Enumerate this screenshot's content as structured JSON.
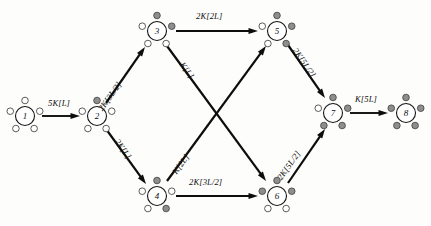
{
  "figure": {
    "node_fill_color": "#ffffff",
    "satellite_open_color": "#ffffff",
    "satellite_filled_color": "#8e8e8e",
    "stroke_color": "#0d0d0d"
  },
  "nodes": [
    {
      "id": "1",
      "label": "1",
      "cx": 25,
      "cy": 116,
      "r": 9.5,
      "sat_r": 3.3,
      "sat_orbit": 15.5,
      "satellites": [
        "open",
        "open",
        "open",
        "open",
        "open"
      ]
    },
    {
      "id": "2",
      "label": "2",
      "cx": 97,
      "cy": 116,
      "r": 9.5,
      "sat_r": 3.3,
      "sat_orbit": 15.5,
      "satellites": [
        "filled",
        "open",
        "open",
        "open",
        "open"
      ]
    },
    {
      "id": "3",
      "label": "3",
      "cx": 157,
      "cy": 31,
      "r": 9.5,
      "sat_r": 3.3,
      "sat_orbit": 15.5,
      "satellites": [
        "filled",
        "filled",
        "open",
        "open",
        "open"
      ]
    },
    {
      "id": "4",
      "label": "4",
      "cx": 157,
      "cy": 196,
      "r": 9.5,
      "sat_r": 3.3,
      "sat_orbit": 15.5,
      "satellites": [
        "filled",
        "open",
        "filled",
        "open",
        "open"
      ]
    },
    {
      "id": "5",
      "label": "5",
      "cx": 277,
      "cy": 31,
      "r": 9.5,
      "sat_r": 3.3,
      "sat_orbit": 15.5,
      "satellites": [
        "filled",
        "filled",
        "filled",
        "open",
        "open"
      ]
    },
    {
      "id": "6",
      "label": "6",
      "cx": 277,
      "cy": 196,
      "r": 9.5,
      "sat_r": 3.3,
      "sat_orbit": 15.5,
      "satellites": [
        "filled",
        "filled",
        "open",
        "open",
        "filled"
      ]
    },
    {
      "id": "7",
      "label": "7",
      "cx": 333,
      "cy": 113,
      "r": 9.5,
      "sat_r": 3.3,
      "sat_orbit": 15.5,
      "satellites": [
        "filled",
        "filled",
        "filled",
        "filled",
        "open"
      ]
    },
    {
      "id": "8",
      "label": "8",
      "cx": 406,
      "cy": 113,
      "r": 9.5,
      "sat_r": 3.3,
      "sat_orbit": 15.5,
      "satellites": [
        "filled",
        "filled",
        "filled",
        "filled",
        "filled"
      ]
    }
  ],
  "edges": [
    {
      "id": "e1-2",
      "from": "1",
      "to": "2",
      "label": "5K[L]",
      "x1": 42,
      "y1": 116,
      "x2": 80,
      "y2": 116,
      "label_x": 48,
      "label_y": 98,
      "rotate": 0,
      "width": 1.9
    },
    {
      "id": "e2-3",
      "from": "2",
      "to": "3",
      "label": "2K[3L/2]",
      "x1": 106,
      "y1": 103,
      "x2": 145,
      "y2": 47,
      "label_x": 96,
      "label_y": 107,
      "rotate": -55,
      "width": 2.2
    },
    {
      "id": "e2-4",
      "from": "2",
      "to": "4",
      "label": "2K[L]",
      "x1": 106,
      "y1": 129,
      "x2": 146,
      "y2": 184,
      "label_x": 121,
      "label_y": 137,
      "rotate": 55,
      "width": 2.2
    },
    {
      "id": "e3-5",
      "from": "3",
      "to": "5",
      "label": "2K[2L]",
      "x1": 176,
      "y1": 31,
      "x2": 258,
      "y2": 31,
      "label_x": 196,
      "label_y": 11,
      "rotate": 0,
      "width": 2.2
    },
    {
      "id": "e3-6",
      "from": "3",
      "to": "6",
      "label": "K[L]",
      "x1": 167,
      "y1": 46,
      "x2": 266,
      "y2": 181,
      "label_x": 186,
      "label_y": 60,
      "rotate": 54,
      "width": 2.2
    },
    {
      "id": "e4-5",
      "from": "4",
      "to": "5",
      "label": "K[2L]",
      "x1": 167,
      "y1": 181,
      "x2": 266,
      "y2": 46,
      "label_x": 170,
      "label_y": 170,
      "rotate": -54,
      "width": 2.2
    },
    {
      "id": "e4-6",
      "from": "4",
      "to": "6",
      "label": "2K[3L/2]",
      "x1": 176,
      "y1": 196,
      "x2": 258,
      "y2": 196,
      "label_x": 189,
      "label_y": 177,
      "rotate": 0,
      "width": 2.2
    },
    {
      "id": "e5-7",
      "from": "5",
      "to": "7",
      "label": "2K[5L/2]",
      "x1": 288,
      "y1": 45,
      "x2": 325,
      "y2": 98,
      "label_x": 299,
      "label_y": 46,
      "rotate": 55,
      "width": 2.2
    },
    {
      "id": "e6-7",
      "from": "6",
      "to": "7",
      "label": "2K[5L/2]",
      "x1": 288,
      "y1": 183,
      "x2": 325,
      "y2": 129,
      "label_x": 275,
      "label_y": 176,
      "rotate": -55,
      "width": 2.2
    },
    {
      "id": "e7-8",
      "from": "7",
      "to": "8",
      "label": "K[5L]",
      "x1": 350,
      "y1": 113,
      "x2": 388,
      "y2": 113,
      "label_x": 355,
      "label_y": 94,
      "rotate": 0,
      "width": 1.9
    }
  ]
}
